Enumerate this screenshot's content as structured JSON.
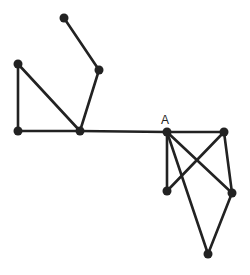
{
  "diagram": {
    "type": "graph",
    "colors": {
      "edge": "#222222",
      "node": "#222222",
      "background": "#ffffff"
    },
    "nodes": [
      {
        "id": "n1",
        "x": 64,
        "y": 18,
        "label": ""
      },
      {
        "id": "n2",
        "x": 99,
        "y": 70,
        "label": ""
      },
      {
        "id": "n3",
        "x": 18,
        "y": 64,
        "label": ""
      },
      {
        "id": "n4",
        "x": 18,
        "y": 131,
        "label": ""
      },
      {
        "id": "n5",
        "x": 80,
        "y": 131,
        "label": ""
      },
      {
        "id": "A",
        "x": 167,
        "y": 132,
        "label": "A"
      },
      {
        "id": "n7",
        "x": 224,
        "y": 132,
        "label": ""
      },
      {
        "id": "n8",
        "x": 167,
        "y": 191,
        "label": ""
      },
      {
        "id": "n9",
        "x": 232,
        "y": 193,
        "label": ""
      },
      {
        "id": "n10",
        "x": 208,
        "y": 254,
        "label": ""
      }
    ],
    "edges": [
      [
        "n1",
        "n2"
      ],
      [
        "n2",
        "n5"
      ],
      [
        "n3",
        "n5"
      ],
      [
        "n3",
        "n4"
      ],
      [
        "n4",
        "n5"
      ],
      [
        "n5",
        "A"
      ],
      [
        "A",
        "n7"
      ],
      [
        "A",
        "n8"
      ],
      [
        "A",
        "n9"
      ],
      [
        "A",
        "n10"
      ],
      [
        "n7",
        "n8"
      ],
      [
        "n7",
        "n9"
      ],
      [
        "n9",
        "n10"
      ]
    ],
    "labels": {
      "A": "A"
    }
  }
}
